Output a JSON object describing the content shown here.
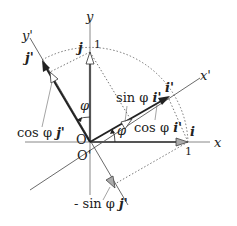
{
  "diagram": {
    "axes": {
      "x": "x",
      "y": "y",
      "x_prime": "x'",
      "y_prime": "y'"
    },
    "origins": {
      "o": "O",
      "o_prime": "O'"
    },
    "vectors": {
      "i": "i",
      "j": "j",
      "i_prime": "i'",
      "j_prime": "j'"
    },
    "unit_marks": {
      "x_one": "1",
      "y_one": "1"
    },
    "angles": {
      "phi_x": "φ",
      "phi_y": "φ"
    },
    "components": {
      "sin_phi_i_prime": {
        "prefix": "sin φ ",
        "vec": "i'"
      },
      "cos_phi_i_prime": {
        "prefix": "cos φ ",
        "vec": "i'"
      },
      "cos_phi_j_prime": {
        "prefix": "cos φ ",
        "vec": "j'"
      },
      "neg_sin_phi_j_prime": {
        "prefix": "- sin φ ",
        "vec": "j'"
      }
    },
    "colors": {
      "axis": "#888888",
      "vector": "#222222",
      "dotted": "#555555",
      "hollow_head": "#ffffff",
      "gray_head": "#aaaaaa"
    }
  }
}
